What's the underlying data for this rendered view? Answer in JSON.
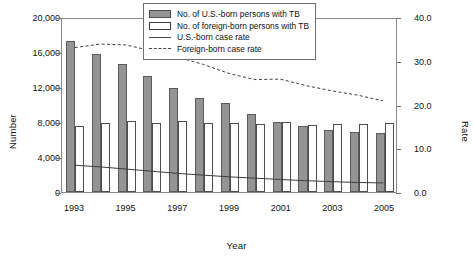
{
  "chart_data": {
    "type": "bar",
    "title": "",
    "xlabel": "Year",
    "ylabel": "Number",
    "y2label": "Rate",
    "grid": false,
    "legend_position": "top-right",
    "categories": [
      1993,
      1994,
      1995,
      1996,
      1997,
      1998,
      1999,
      2000,
      2001,
      2002,
      2003,
      2004,
      2005
    ],
    "xtick_labels": [
      "1993",
      "1995",
      "1997",
      "1999",
      "2001",
      "2003",
      "2005"
    ],
    "xtick_values": [
      1993,
      1995,
      1997,
      1999,
      2001,
      2003,
      2005
    ],
    "ylim": [
      0,
      20000
    ],
    "ytick_labels": [
      "0",
      "4,000",
      "8,000",
      "12,000",
      "16,000",
      "20,000"
    ],
    "ytick_values": [
      0,
      4000,
      8000,
      12000,
      16000,
      20000
    ],
    "y2lim": [
      0,
      40
    ],
    "y2tick_labels": [
      "0.0",
      "10.0",
      "20.0",
      "30.0",
      "40.0"
    ],
    "y2tick_values": [
      0,
      10,
      20,
      30,
      40
    ],
    "series": [
      {
        "name": "No. of U.S.-born persons with TB",
        "kind": "bar",
        "axis": "left",
        "color": "#949494",
        "values": [
          17300,
          15800,
          14600,
          13300,
          11900,
          10800,
          10200,
          8900,
          8000,
          7500,
          7100,
          6900,
          6800
        ]
      },
      {
        "name": "No. of foreign-born persons with TB",
        "kind": "bar",
        "axis": "left",
        "color": "#ffffff",
        "values": [
          7500,
          7900,
          8100,
          7900,
          8100,
          7900,
          7900,
          7800,
          8000,
          7700,
          7800,
          7800,
          7900
        ]
      },
      {
        "name": "U.S.-born case rate",
        "kind": "line",
        "axis": "right",
        "color": "#3d3d3d",
        "style": "solid",
        "values": [
          6.2,
          5.8,
          5.3,
          4.8,
          4.3,
          3.9,
          3.5,
          3.2,
          2.9,
          2.6,
          2.4,
          2.2,
          2.1
        ]
      },
      {
        "name": "Foreign-born case rate",
        "kind": "line",
        "axis": "right",
        "color": "#3d3d3d",
        "style": "dashed",
        "values": [
          33.4,
          34.2,
          34.0,
          32.6,
          31.2,
          29.5,
          27.4,
          26.0,
          26.1,
          24.6,
          23.4,
          22.4,
          21.1
        ]
      }
    ]
  },
  "legend": {
    "items": [
      {
        "label": "No. of U.S.-born persons with TB",
        "key": "filled-gray-swatch"
      },
      {
        "label": "No. of foreign-born persons with TB",
        "key": "open-white-swatch"
      },
      {
        "label": "U.S.-born case rate",
        "key": "solid-line"
      },
      {
        "label": "Foreign-born case rate",
        "key": "dashed-line"
      }
    ]
  }
}
